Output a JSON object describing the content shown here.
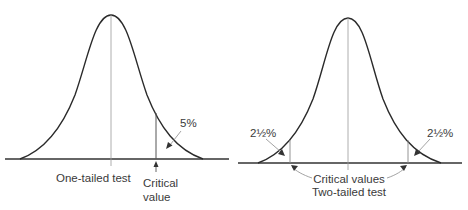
{
  "diagram": {
    "left": {
      "title": "One-tailed test",
      "tail_label": "5%",
      "critical_label_line1": "Critical",
      "critical_label_line2": "value"
    },
    "right": {
      "title": "Two-tailed test",
      "critical_label": "Critical values",
      "left_tail_label": "2½%",
      "right_tail_label": "2½%"
    },
    "colors": {
      "curve": "#2a2a2a",
      "axis": "#333333",
      "guide": "#9a9a9a",
      "text": "#3a3a3a"
    }
  }
}
